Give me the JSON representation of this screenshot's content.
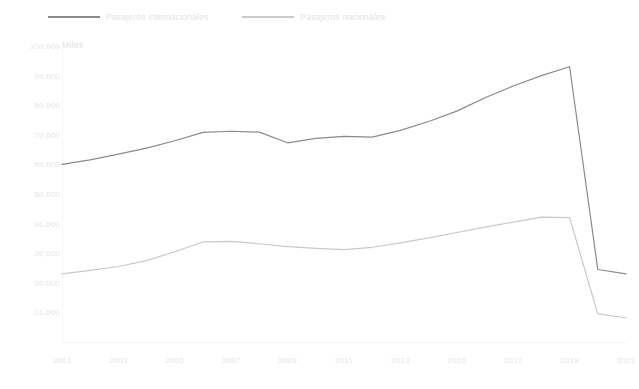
{
  "chart_data": {
    "type": "line",
    "title": "",
    "subtitle": "",
    "units_caption": "Miles",
    "xlabel": "",
    "ylabel": "",
    "x": [
      2001,
      2002,
      2003,
      2004,
      2005,
      2006,
      2007,
      2008,
      2009,
      2010,
      2011,
      2012,
      2013,
      2014,
      2015,
      2016,
      2017,
      2018,
      2019,
      2020,
      2021
    ],
    "xtick_labels": [
      "2001",
      "2003",
      "2005",
      "2007",
      "2009",
      "2011",
      "2013",
      "2015",
      "2017",
      "2019",
      "2021"
    ],
    "xlim": [
      2001,
      2021
    ],
    "ylim": [
      0,
      100000
    ],
    "ytick_labels": [
      "100,000",
      "90,000",
      "80,000",
      "70,000",
      "60,000",
      "50,000",
      "40,000",
      "30,000",
      "20,000",
      "10,000"
    ],
    "ytick_values": [
      100000,
      90000,
      80000,
      70000,
      60000,
      50000,
      40000,
      30000,
      20000,
      10000
    ],
    "grid": false,
    "legend_position": "top-left",
    "series": [
      {
        "name": "Pasajeros internacionales",
        "color": "#8a8a8a",
        "values": [
          60000,
          61500,
          63500,
          65500,
          68000,
          70800,
          71200,
          70900,
          67300,
          68800,
          69500,
          69200,
          71500,
          74500,
          78000,
          82500,
          86500,
          90000,
          93000,
          24500,
          23000
        ]
      },
      {
        "name": "Pasajeros nacionales",
        "color": "#c9c9c9",
        "values": [
          23000,
          24200,
          25500,
          27500,
          30500,
          33800,
          34000,
          33200,
          32200,
          31600,
          31200,
          32000,
          33500,
          35200,
          37000,
          38800,
          40500,
          42200,
          42000,
          9500,
          8200
        ]
      }
    ]
  }
}
